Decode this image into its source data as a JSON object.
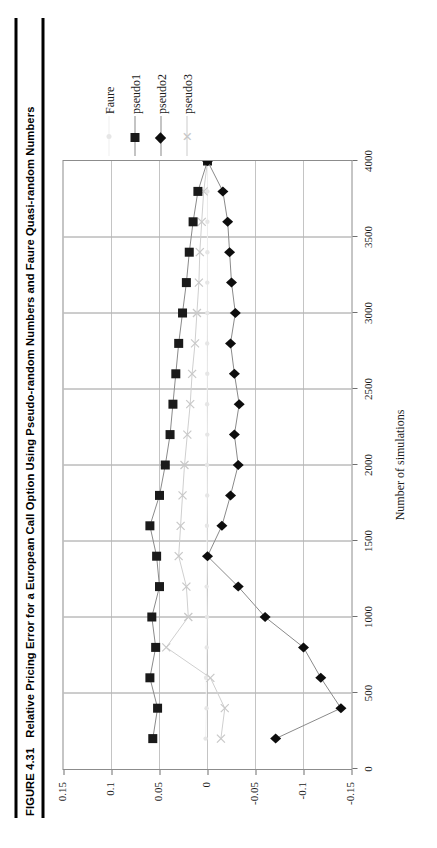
{
  "figure": {
    "number_label": "FIGURE 4.31",
    "caption": "Relative Pricing Error for a European Call Option Using Pseudo-random Numbers and Faure Quasi-random Numbers"
  },
  "legend": {
    "position": "right",
    "entries": [
      {
        "label": "Faure",
        "marker": "dot-icon",
        "color": "#e6e6e6",
        "line_color": "#f0f0f0"
      },
      {
        "label": "pseudo1",
        "marker": "square-icon",
        "color": "#1a1a1a",
        "line_color": "#8a8a8a"
      },
      {
        "label": "pseudo2",
        "marker": "diamond-icon",
        "color": "#0d0d0d",
        "line_color": "#8a8a8a"
      },
      {
        "label": "pseudo3",
        "marker": "x-icon",
        "color": "#c8c8c8",
        "line_color": "#cccccc"
      }
    ]
  },
  "chart_data": {
    "type": "line",
    "title": "Relative Pricing Error for a European Call Option Using Pseudo-random Numbers and Faure Quasi-random Numbers",
    "xlabel": "Number of simulations",
    "ylabel": "",
    "grid": true,
    "xlim": [
      0,
      4000
    ],
    "ylim": [
      -0.15,
      0.15
    ],
    "xticks": [
      0,
      500,
      1000,
      1500,
      2000,
      2500,
      3000,
      3500,
      4000
    ],
    "xtick_labels": [
      "0",
      "500",
      "1000",
      "1500",
      "2000",
      "2500",
      "3000",
      "3500",
      "4000"
    ],
    "yticks": [
      0.15,
      0.1,
      0.05,
      0,
      -0.05,
      -0.1,
      -0.15
    ],
    "ytick_labels": [
      "0.15",
      "0.1",
      "0.05",
      "0",
      "-0.05",
      "-0.1",
      "-0.15"
    ],
    "x": [
      200,
      400,
      600,
      800,
      1000,
      1200,
      1400,
      1600,
      1800,
      2000,
      2200,
      2400,
      2600,
      2800,
      3000,
      3200,
      3400,
      3600,
      3800,
      4000
    ],
    "series": [
      {
        "name": "Faure",
        "marker": "dot-icon",
        "color": "#e6e6e6",
        "values": [
          0.002,
          0.001,
          0.0015,
          0.0008,
          0.0005,
          0.0009,
          0.0004,
          0.0006,
          0.0003,
          0.0005,
          0.0002,
          0.0004,
          0.0002,
          0.0003,
          0.0002,
          0.0002,
          0.0001,
          0.0001,
          0.0001,
          0.0
        ]
      },
      {
        "name": "pseudo1",
        "marker": "square-icon",
        "color": "#1a1a1a",
        "values": [
          0.057,
          0.052,
          0.06,
          0.054,
          0.058,
          0.05,
          0.053,
          0.06,
          0.05,
          0.044,
          0.039,
          0.036,
          0.033,
          0.03,
          0.026,
          0.022,
          0.019,
          0.015,
          0.01,
          0.0
        ]
      },
      {
        "name": "pseudo2",
        "marker": "diamond-icon",
        "color": "#0d0d0d",
        "values": [
          -0.071,
          -0.139,
          -0.118,
          -0.1,
          -0.06,
          -0.032,
          0.0,
          -0.015,
          -0.024,
          -0.032,
          -0.028,
          -0.033,
          -0.028,
          -0.024,
          -0.029,
          -0.025,
          -0.023,
          -0.021,
          -0.016,
          0.0
        ]
      },
      {
        "name": "pseudo3",
        "marker": "x-icon",
        "color": "#c8c8c8",
        "values": [
          -0.014,
          -0.018,
          -0.003,
          0.043,
          0.02,
          0.022,
          0.03,
          0.028,
          0.026,
          0.024,
          0.021,
          0.018,
          0.016,
          0.013,
          0.011,
          0.009,
          0.008,
          0.006,
          0.004,
          0.0
        ]
      }
    ]
  }
}
